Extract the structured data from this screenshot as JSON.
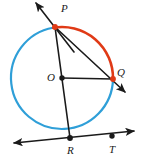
{
  "figure": {
    "type": "geometry-diagram",
    "canvas": {
      "width": 141,
      "height": 159,
      "background": "#ffffff"
    },
    "colors": {
      "arc_highlight": "#e03a16",
      "arc_base": "#2f9fd8",
      "line": "#1a1a1a",
      "point": "#1a1a1a",
      "point_on_highlight": "#e03a16",
      "label": "#1a1a1a"
    },
    "circle": {
      "center_label": "O",
      "cx": 62,
      "cy": 78,
      "r": 51,
      "stroke_width": 2.2
    },
    "points": [
      {
        "id": "P",
        "label": "P",
        "x": 55,
        "y": 27,
        "label_x": 61,
        "label_y": 12,
        "dot_color": "#e03a16",
        "on_circle": true
      },
      {
        "id": "Q",
        "label": "Q",
        "x": 113,
        "y": 79,
        "label_x": 117,
        "label_y": 76,
        "dot_color": "#e03a16",
        "on_circle": true
      },
      {
        "id": "O",
        "label": "O",
        "x": 62,
        "y": 78,
        "label_x": 47,
        "label_y": 81,
        "dot_color": "#1a1a1a",
        "on_circle": false
      },
      {
        "id": "R",
        "label": "R",
        "x": 70,
        "y": 138,
        "label_x": 67,
        "label_y": 154,
        "dot_color": "#1a1a1a",
        "on_circle": true
      },
      {
        "id": "T",
        "label": "T",
        "x": 112,
        "y": 136,
        "label_x": 109,
        "label_y": 153,
        "dot_color": "#1a1a1a",
        "on_circle": false
      }
    ],
    "arcs": [
      {
        "name": "arc-PQ-highlight",
        "color": "#e03a16",
        "from_deg": -100,
        "to_deg": 1,
        "description": "major arc from P clockwise to Q, highlighted red"
      },
      {
        "name": "arc-QRP-base",
        "color": "#2f9fd8",
        "from_deg": 1,
        "to_deg": 260,
        "description": "remaining arc from Q through R back to P, blue"
      }
    ],
    "segments": [
      {
        "name": "tangent-at-P",
        "x1": 36,
        "y1": 3,
        "x2": 74,
        "y2": 52,
        "arrow_start": true,
        "arrow_end": false
      },
      {
        "name": "secant-P-Q",
        "x1": 55,
        "y1": 27,
        "x2": 125,
        "y2": 92,
        "arrow_start": false,
        "arrow_end": true
      },
      {
        "name": "radius-O-Q",
        "x1": 62,
        "y1": 78,
        "x2": 113,
        "y2": 79,
        "arrow_start": false,
        "arrow_end": false
      },
      {
        "name": "chord-P-R",
        "x1": 55,
        "y1": 27,
        "x2": 70,
        "y2": 138,
        "arrow_start": false,
        "arrow_end": false
      },
      {
        "name": "tangent-line-R-T",
        "x1": 14,
        "y1": 143,
        "x2": 134,
        "y2": 131,
        "arrow_start": true,
        "arrow_end": true
      }
    ]
  }
}
